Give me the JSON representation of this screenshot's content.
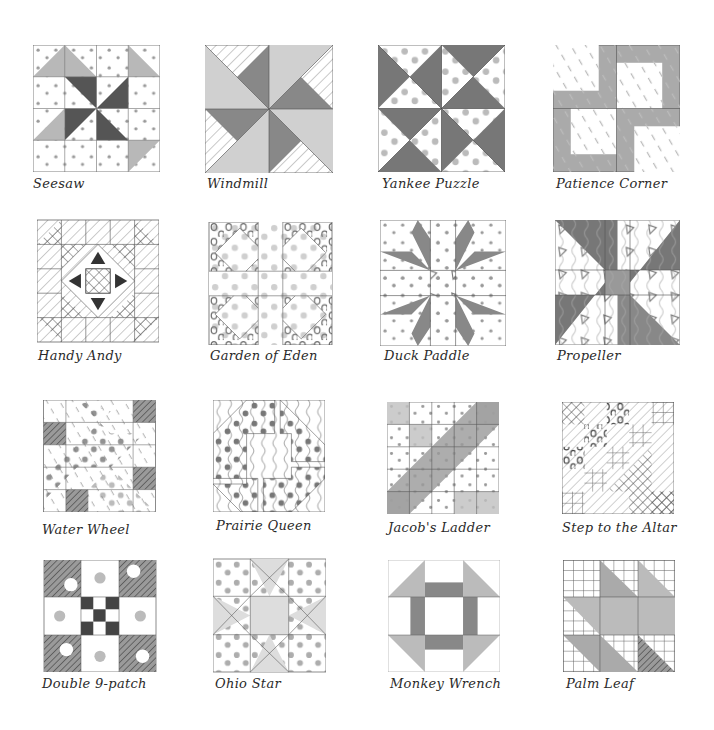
{
  "colors": {
    "paper": "#ffffff",
    "pencil": "#3a3a3a",
    "mid": "#8a8a8a",
    "light": "#c8c8c8",
    "dark": "#555555"
  },
  "blocks": [
    {
      "name": "Seesaw"
    },
    {
      "name": "Windmill"
    },
    {
      "name": "Yankee Puzzle"
    },
    {
      "name": "Patience Corner"
    },
    {
      "name": "Handy Andy"
    },
    {
      "name": "Garden of Eden"
    },
    {
      "name": "Duck Paddle"
    },
    {
      "name": "Propeller"
    },
    {
      "name": "Water Wheel"
    },
    {
      "name": "Prairie Queen"
    },
    {
      "name": "Jacob's Ladder"
    },
    {
      "name": "Step to the Altar"
    },
    {
      "name": "Double 9-patch"
    },
    {
      "name": "Ohio Star"
    },
    {
      "name": "Monkey Wrench"
    },
    {
      "name": "Palm Leaf"
    }
  ]
}
